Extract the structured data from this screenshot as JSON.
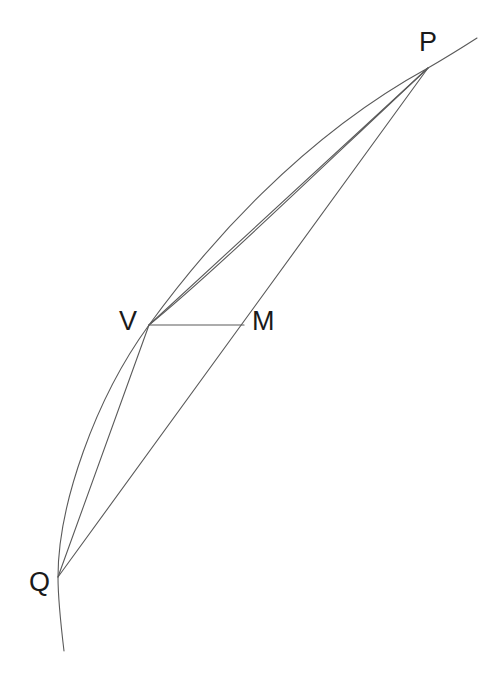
{
  "figure": {
    "name": "parabola-chord-diagram",
    "background_color": "#ffffff",
    "stroke_color": "#5a5a5a",
    "label_color": "#1a1a1a",
    "stroke_width": 1.1
  },
  "points": [
    {
      "id": "P",
      "label": "P",
      "x": 428,
      "y": 68,
      "label_x": 419,
      "label_y": 29
    },
    {
      "id": "V",
      "label": "V",
      "x": 149,
      "y": 325,
      "label_x": 119,
      "label_y": 308
    },
    {
      "id": "M",
      "label": "M",
      "x": 244,
      "y": 325,
      "label_x": 252,
      "label_y": 308
    },
    {
      "id": "Q",
      "label": "Q",
      "x": 58,
      "y": 577,
      "label_x": 29,
      "label_y": 569
    }
  ],
  "segments": [
    {
      "id": "chord-QP",
      "from": "Q",
      "to": "P",
      "kind": "chord"
    },
    {
      "id": "chord-QV",
      "from": "Q",
      "to": "V",
      "kind": "chord"
    },
    {
      "id": "chord-VP",
      "from": "V",
      "to": "P",
      "kind": "chord"
    },
    {
      "id": "segment-VM",
      "from": "V",
      "to": "M",
      "kind": "diameter-segment"
    }
  ],
  "curve": {
    "id": "parabolic-arc",
    "kind": "conic-arc",
    "passes_through": [
      "Q",
      "V",
      "P"
    ],
    "path": "M 64 651 C 61 626 58 601 58 577 C 58 505 95 399 149 325 C 205 248 300 138 428 68 C 447 57 463 47 477 38"
  },
  "paths": {
    "chord_QP": "M 58 577 L 428 68",
    "chord_QV": "M 58 577 L 149 325",
    "chord_VP": "M 149 325 L 428 68",
    "segment_VM": "M 149 325 L 244 325",
    "arc_VP_outer": "M 149 325 C 214 272 320 169 428 68"
  }
}
